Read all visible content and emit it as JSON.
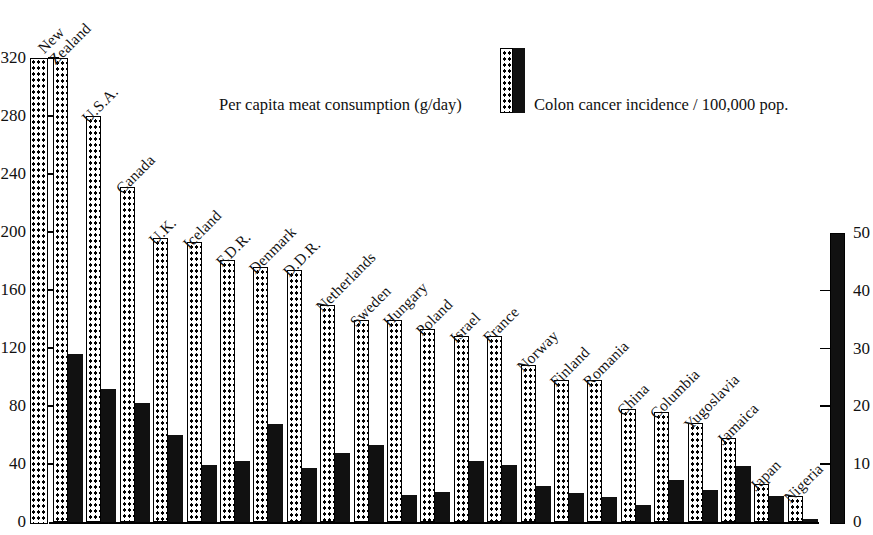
{
  "legend": {
    "meat_label": "Per capita meat consumption (g/day)",
    "cancer_label": "Colon cancer incidence / 100,000 pop.",
    "meat_swatch_icon": "dotted-bar-icon",
    "cancer_swatch_icon": "solid-bar-icon"
  },
  "axes": {
    "left": {
      "title": "Per capita meat consumption (g/day)",
      "ticks": [
        "320",
        "280",
        "240",
        "200",
        "160",
        "120",
        "80",
        "40",
        "0"
      ],
      "min": 0,
      "max": 320,
      "step": 40
    },
    "right": {
      "title": "Colon cancer incidence / 100,000 pop.",
      "ticks": [
        "50",
        "40",
        "30",
        "20",
        "10",
        "0"
      ],
      "min": 0,
      "max": 50,
      "step": 10
    }
  },
  "chart_data": {
    "type": "bar",
    "title": "",
    "xlabel": "",
    "ylabel": "Per capita meat consumption (g/day)",
    "y2label": "Colon cancer incidence / 100,000 pop.",
    "ylim": [
      0,
      320
    ],
    "y2lim": [
      0,
      50
    ],
    "grid": false,
    "legend_position": "top-center",
    "categories": [
      "New Zealand",
      "U.S.A.",
      "Canada",
      "U.K.",
      "Iceland",
      "F.D.R.",
      "Denmark",
      "D.D.R.",
      "Netherlands",
      "Sweden",
      "Hungary",
      "Poland",
      "Israel",
      "France",
      "Norway",
      "Finland",
      "Romania",
      "China",
      "Columbia",
      "Yugoslavia",
      "Jamaica",
      "Japan",
      "Nigeria"
    ],
    "series": [
      {
        "name": "Per capita meat consumption (g/day)",
        "axis": "left",
        "style": "dotted",
        "color": "#ffffff",
        "values": [
          320,
          280,
          231,
          196,
          193,
          181,
          176,
          174,
          150,
          139,
          139,
          133,
          128,
          128,
          108,
          98,
          98,
          78,
          76,
          68,
          58,
          26,
          18
        ]
      },
      {
        "name": "Colon cancer incidence / 100,000 pop.",
        "axis": "right",
        "style": "solid",
        "color": "#111111",
        "values": [
          29.0,
          23.0,
          20.6,
          15.0,
          9.8,
          10.5,
          17.0,
          9.3,
          12.0,
          13.3,
          4.6,
          5.2,
          10.5,
          9.9,
          6.3,
          5.0,
          4.3,
          3.0,
          7.3,
          5.5,
          9.7,
          4.5,
          0.5
        ]
      }
    ]
  },
  "bars": [
    {
      "country": "New Zealand",
      "label_lines": [
        "New",
        "Zealand"
      ],
      "meat": 320,
      "cancer": 29.0
    },
    {
      "country": "U.S.A.",
      "label_lines": [
        "U.S.A."
      ],
      "meat": 280,
      "cancer": 23.0
    },
    {
      "country": "Canada",
      "label_lines": [
        "Canada"
      ],
      "meat": 231,
      "cancer": 20.6
    },
    {
      "country": "U.K.",
      "label_lines": [
        "U.K."
      ],
      "meat": 196,
      "cancer": 15.0
    },
    {
      "country": "Iceland",
      "label_lines": [
        "Iceland"
      ],
      "meat": 193,
      "cancer": 9.8
    },
    {
      "country": "F.D.R.",
      "label_lines": [
        "F.D.R."
      ],
      "meat": 181,
      "cancer": 10.5
    },
    {
      "country": "Denmark",
      "label_lines": [
        "Denmark"
      ],
      "meat": 176,
      "cancer": 17.0
    },
    {
      "country": "D.D.R.",
      "label_lines": [
        "D.D.R."
      ],
      "meat": 174,
      "cancer": 9.3
    },
    {
      "country": "Netherlands",
      "label_lines": [
        "Netherlands"
      ],
      "meat": 150,
      "cancer": 12.0
    },
    {
      "country": "Sweden",
      "label_lines": [
        "Sweden"
      ],
      "meat": 139,
      "cancer": 13.3
    },
    {
      "country": "Hungary",
      "label_lines": [
        "Hungary"
      ],
      "meat": 139,
      "cancer": 4.6
    },
    {
      "country": "Poland",
      "label_lines": [
        "Poland"
      ],
      "meat": 133,
      "cancer": 5.2
    },
    {
      "country": "Israel",
      "label_lines": [
        "Israel"
      ],
      "meat": 128,
      "cancer": 10.5
    },
    {
      "country": "France",
      "label_lines": [
        "France"
      ],
      "meat": 128,
      "cancer": 9.9
    },
    {
      "country": "Norway",
      "label_lines": [
        "Norway"
      ],
      "meat": 108,
      "cancer": 6.3
    },
    {
      "country": "Finland",
      "label_lines": [
        "Finland"
      ],
      "meat": 98,
      "cancer": 5.0
    },
    {
      "country": "Romania",
      "label_lines": [
        "Romania"
      ],
      "meat": 98,
      "cancer": 4.3
    },
    {
      "country": "China",
      "label_lines": [
        "China"
      ],
      "meat": 78,
      "cancer": 3.0
    },
    {
      "country": "Columbia",
      "label_lines": [
        "Columbia"
      ],
      "meat": 76,
      "cancer": 7.3
    },
    {
      "country": "Yugoslavia",
      "label_lines": [
        "Yugoslavia"
      ],
      "meat": 68,
      "cancer": 5.5
    },
    {
      "country": "Jamaica",
      "label_lines": [
        "Jamaica"
      ],
      "meat": 58,
      "cancer": 9.7
    },
    {
      "country": "Japan",
      "label_lines": [
        "Japan"
      ],
      "meat": 26,
      "cancer": 4.5
    },
    {
      "country": "Nigeria",
      "label_lines": [
        "Nigeria"
      ],
      "meat": 18,
      "cancer": 0.5
    }
  ]
}
